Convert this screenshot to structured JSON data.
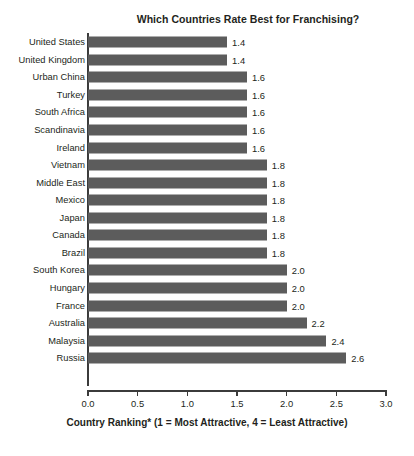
{
  "chart_data": {
    "type": "bar",
    "orientation": "horizontal",
    "title": "Which Countries Rate Best for Franchising?",
    "xlabel": "Country Ranking* (1 = Most Attractive, 4 = Least Attractive)",
    "ylabel": "",
    "xlim": [
      0.0,
      3.0
    ],
    "grid": false,
    "legend": null,
    "bar_color": "#5c5c5c",
    "text_color": "#231f20",
    "axis_color": "#3b3b3b",
    "background": "#ffffff",
    "xticks": [
      "0.0",
      "0.5",
      "1.0",
      "1.5",
      "2.0",
      "2.5",
      "3.0"
    ],
    "xtick_values": [
      0.0,
      0.5,
      1.0,
      1.5,
      2.0,
      2.5,
      3.0
    ],
    "categories": [
      "United States",
      "United Kingdom",
      "Urban China",
      "Turkey",
      "South Africa",
      "Scandinavia",
      "Ireland",
      "Vietnam",
      "Middle East",
      "Mexico",
      "Japan",
      "Canada",
      "Brazil",
      "South Korea",
      "Hungary",
      "France",
      "Australia",
      "Malaysia",
      "Russia"
    ],
    "values": [
      1.4,
      1.4,
      1.6,
      1.6,
      1.6,
      1.6,
      1.6,
      1.8,
      1.8,
      1.8,
      1.8,
      1.8,
      1.8,
      2.0,
      2.0,
      2.0,
      2.2,
      2.4,
      2.6
    ],
    "value_labels": [
      "1.4",
      "1.4",
      "1.6",
      "1.6",
      "1.6",
      "1.6",
      "1.6",
      "1.8",
      "1.8",
      "1.8",
      "1.8",
      "1.8",
      "1.8",
      "2.0",
      "2.0",
      "2.0",
      "2.2",
      "2.4",
      "2.6"
    ]
  }
}
